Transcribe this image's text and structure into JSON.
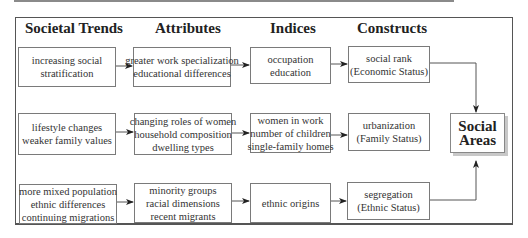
{
  "headers": {
    "societal_trends": "Societal Trends",
    "attributes": "Attributes",
    "indices": "Indices",
    "constructs": "Constructs"
  },
  "rows": [
    {
      "trend": [
        "increasing social",
        "stratification"
      ],
      "attributes": [
        "greater work specialization",
        "educational differences"
      ],
      "indices": [
        "occupation",
        "education"
      ],
      "construct": [
        "social rank",
        "(Economic Status)"
      ]
    },
    {
      "trend": [
        "lifestyle changes",
        "weaker family values"
      ],
      "attributes": [
        "changing roles of women",
        "household composition",
        "dwelling types"
      ],
      "indices": [
        "women in work",
        "number of children",
        "single-family homes"
      ],
      "construct": [
        "urbanization",
        "(Family Status)"
      ]
    },
    {
      "trend": [
        "more mixed population",
        "ethnic differences",
        "continuing migrations"
      ],
      "attributes": [
        "minority groups",
        "racial dimensions",
        "recent migrants"
      ],
      "indices": [
        "ethnic origins"
      ],
      "construct": [
        "segregation",
        "(Ethnic Status)"
      ]
    }
  ],
  "outcome": [
    "Social",
    "Areas"
  ],
  "colors": {
    "border": "#7a7a7a",
    "text": "#333333",
    "shadow": "#c8c8c8"
  }
}
